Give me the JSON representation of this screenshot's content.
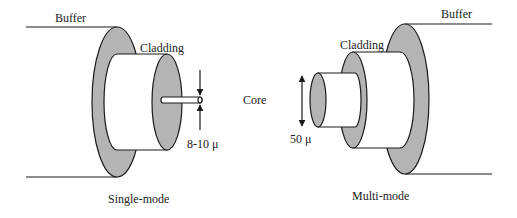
{
  "diagram": {
    "type": "optical-fiber-cross-section",
    "colors": {
      "shading": "#b4b4b4",
      "line": "#1a1a1a",
      "background": "#ffffff"
    },
    "center_label": "Core",
    "single_mode": {
      "caption": "Single-mode",
      "buffer_label": "Buffer",
      "cladding_label": "Cladding",
      "core_dimension": "8-10 μ"
    },
    "multi_mode": {
      "caption": "Multi-mode",
      "buffer_label": "Buffer",
      "cladding_label": "Cladding",
      "core_dimension": "50 μ"
    }
  }
}
